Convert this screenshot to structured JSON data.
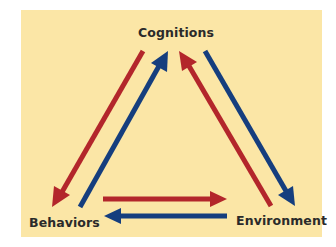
{
  "diagram": {
    "type": "triadic-reciprocal-causation",
    "background_color": "#fbe6a6",
    "colors": {
      "red_arrow": "#b3262b",
      "blue_arrow": "#153e7e",
      "label_text": "#2a2a2a"
    },
    "nodes": [
      {
        "id": "cognitions",
        "label": "Cognitions"
      },
      {
        "id": "behaviors",
        "label": "Behaviors"
      },
      {
        "id": "environment",
        "label": "Environment"
      }
    ],
    "edges": [
      {
        "from": "cognitions",
        "to": "behaviors",
        "color": "red"
      },
      {
        "from": "behaviors",
        "to": "cognitions",
        "color": "blue"
      },
      {
        "from": "environment",
        "to": "cognitions",
        "color": "red"
      },
      {
        "from": "cognitions",
        "to": "environment",
        "color": "blue"
      },
      {
        "from": "behaviors",
        "to": "environment",
        "color": "red"
      },
      {
        "from": "environment",
        "to": "behaviors",
        "color": "blue"
      }
    ]
  }
}
